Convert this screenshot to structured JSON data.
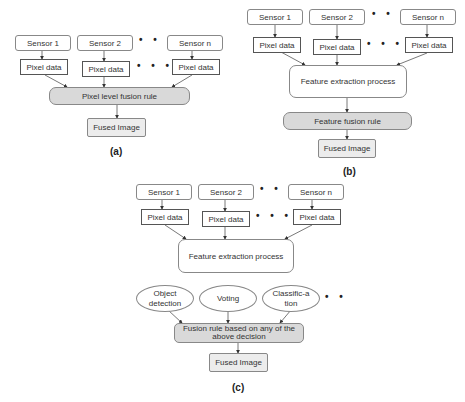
{
  "diagram_a": {
    "sensors": [
      "Sensor 1",
      "Sensor 2",
      "Sensor n"
    ],
    "pixel_data": [
      "Pixel data",
      "Pixel data",
      "Pixel data"
    ],
    "ellipsis": "• • •",
    "fusion_rule": "Pixel level fusion rule",
    "output": "Fused Image",
    "caption": "(a)"
  },
  "diagram_b": {
    "sensors": [
      "Sensor 1",
      "Sensor 2",
      "Sensor n"
    ],
    "pixel_data": [
      "Pixel data",
      "Pixel data",
      "Pixel data"
    ],
    "ellipsis": "• • •",
    "process": "Feature extraction process",
    "fusion_rule": "Feature fusion rule",
    "output": "Fused Image",
    "caption": "(b)"
  },
  "diagram_c": {
    "sensors": [
      "Sensor 1",
      "Sensor 2",
      "Sensor n"
    ],
    "pixel_data": [
      "Pixel data",
      "Pixel data",
      "Pixel data"
    ],
    "ellipsis": "• • •",
    "ellipsis_short": "• •",
    "process": "Feature extraction process",
    "decisions": [
      "Object detection",
      "Voting",
      "Classific-ation"
    ],
    "fusion_rule": "Fusion rule based on any of the above decision",
    "output": "Fused Image",
    "caption": "(c)"
  }
}
